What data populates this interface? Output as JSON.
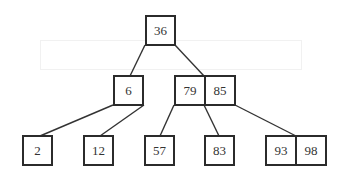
{
  "diagram": {
    "type": "2-3 tree",
    "colors": {
      "border": "#2b2b2b",
      "text": "#333333",
      "edge": "#333333",
      "background": "#ffffff"
    },
    "nodes": {
      "root": {
        "keys": [
          "36"
        ]
      },
      "left": {
        "keys": [
          "6"
        ]
      },
      "right": {
        "keys": [
          "79",
          "85"
        ]
      },
      "leaf1": {
        "keys": [
          "2"
        ]
      },
      "leaf2": {
        "keys": [
          "12"
        ]
      },
      "leaf3": {
        "keys": [
          "57"
        ]
      },
      "leaf4": {
        "keys": [
          "83"
        ]
      },
      "leaf5": {
        "keys": [
          "93",
          "98"
        ]
      }
    },
    "edges": [
      {
        "from": "root",
        "to": "left"
      },
      {
        "from": "root",
        "to": "right"
      },
      {
        "from": "left",
        "to": "leaf1"
      },
      {
        "from": "left",
        "to": "leaf2"
      },
      {
        "from": "right",
        "to": "leaf3"
      },
      {
        "from": "right",
        "to": "leaf4"
      },
      {
        "from": "right",
        "to": "leaf5"
      }
    ]
  }
}
